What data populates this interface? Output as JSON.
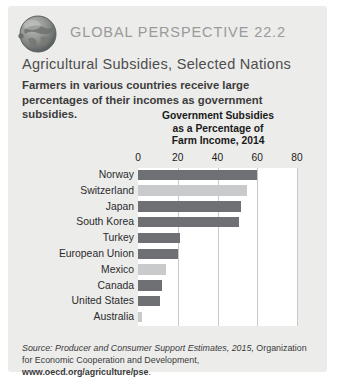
{
  "header": {
    "icon": "globe-icon",
    "kicker": "GLOBAL PERSPECTIVE 22.2",
    "subject": "Agricultural Subsidies, Selected Nations",
    "blurb": "Farmers in various countries receive large percentages of their incomes as government subsidies."
  },
  "source": {
    "label": "Source:",
    "italic_part": " Producer and Consumer Support Estimates, 2015,",
    "plain_part": " Organization for Economic Cooperation and Development, ",
    "bold_part": "www.oecd.org/agriculture/pse",
    "period": "."
  },
  "colors": {
    "panel_bg": "#ececeb",
    "plot_bg": "#ffffff",
    "bar_dark": "#6f7073",
    "bar_light": "#c9cacc",
    "gridline": "#c9c9c9",
    "kicker_text": "#9a9a9a",
    "subject_text": "#4d4d4d"
  },
  "chart_data": {
    "type": "bar",
    "orientation": "horizontal",
    "title": "Government Subsidies as a Percentage of Farm Income, 2014",
    "title_lines": [
      "Government Subsidies",
      "as a Percentage of",
      "Farm Income, 2014"
    ],
    "xlabel": "",
    "ylabel": "",
    "xlim": [
      0,
      80
    ],
    "ticks": [
      0,
      20,
      40,
      60,
      80
    ],
    "tick_labels": [
      "0",
      "20",
      "40",
      "60",
      "80"
    ],
    "grid": true,
    "legend": "none",
    "categories": [
      "Norway",
      "Switzerland",
      "Japan",
      "South Korea",
      "Turkey",
      "European Union",
      "Mexico",
      "Canada",
      "United States",
      "Australia"
    ],
    "values": [
      60,
      55,
      52,
      51,
      21,
      20,
      14,
      12,
      11,
      2
    ],
    "bar_shades": [
      "dark",
      "light",
      "dark",
      "dark",
      "dark",
      "dark",
      "light",
      "dark",
      "dark",
      "light"
    ]
  }
}
